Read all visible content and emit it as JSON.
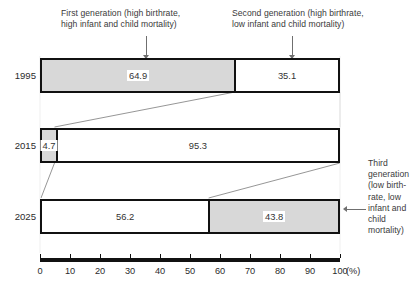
{
  "chart_data": {
    "type": "bar",
    "orientation": "horizontal",
    "stacked": true,
    "title": "",
    "xlabel": "(%)",
    "ylabel": "",
    "xlim": [
      0,
      100
    ],
    "xticks": [
      0,
      10,
      20,
      30,
      40,
      50,
      60,
      70,
      80,
      90,
      100
    ],
    "xtick_labels": [
      "0",
      "10",
      "20",
      "30",
      "40",
      "50",
      "60",
      "70",
      "80",
      "90",
      "100"
    ],
    "unit": "(%)",
    "grid": false,
    "legend_position": "annotations",
    "categories": [
      "1995",
      "2015",
      "2025"
    ],
    "series": [
      {
        "name": "First generation (high birthrate, high infant and child mortality)",
        "fill": "gray",
        "values": [
          64.9,
          4.7,
          0
        ]
      },
      {
        "name": "Second generation (high birthrate, low infant and child mortality)",
        "fill": "white",
        "values": [
          35.1,
          95.3,
          56.2
        ]
      },
      {
        "name": "Third generation (low birthrate, low infant and child mortality)",
        "fill": "gray",
        "values": [
          0,
          0,
          43.8
        ]
      }
    ],
    "bars": [
      {
        "year": "1995",
        "segments": [
          {
            "label": "64.9",
            "value": 64.9,
            "fill": "gray"
          },
          {
            "label": "35.1",
            "value": 35.1,
            "fill": "white"
          }
        ]
      },
      {
        "year": "2015",
        "segments": [
          {
            "label": "4.7",
            "value": 4.7,
            "fill": "gray"
          },
          {
            "label": "95.3",
            "value": 95.3,
            "fill": "white"
          }
        ]
      },
      {
        "year": "2025",
        "segments": [
          {
            "label": "56.2",
            "value": 56.2,
            "fill": "white"
          },
          {
            "label": "43.8",
            "value": 43.8,
            "fill": "gray"
          }
        ]
      }
    ],
    "annotations": [
      {
        "id": "first",
        "text": "First generation (high birthrate,\nhigh infant and child mortality)"
      },
      {
        "id": "second",
        "text": "Second generation (high birthrate,\nlow infant and child mortality)"
      },
      {
        "id": "third",
        "text": "Third\ngeneration\n(low birth-\nrate, low\ninfant and\nchild\nmortality)"
      }
    ],
    "colors": {
      "segment_gray": "#d8d8d8",
      "segment_white": "#ffffff",
      "bar_outline": "#111111",
      "text": "#2b2b2b",
      "leader": "#6f6f6f",
      "connector": "#8a8a8a"
    }
  }
}
